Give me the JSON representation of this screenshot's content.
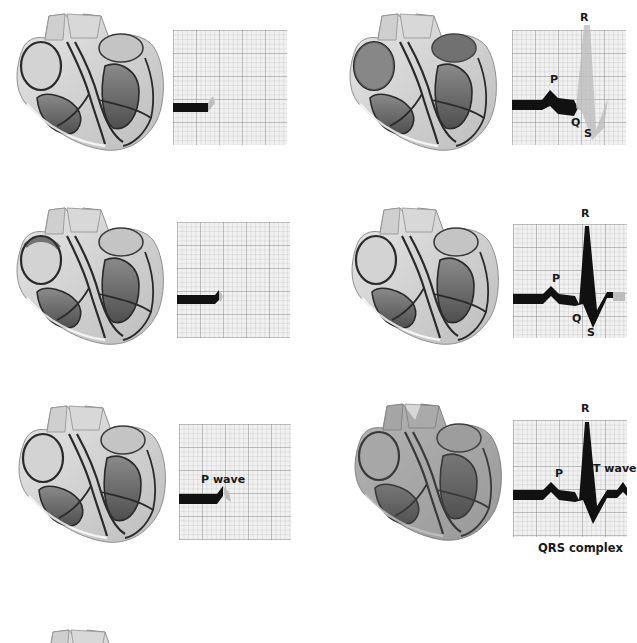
{
  "diagram": {
    "title": "",
    "panels": [
      {
        "id": "panel-1",
        "heart_stage": "sinus node fires",
        "ecg_labels": []
      },
      {
        "id": "panel-2",
        "heart_stage": "atrial depolarization spreading",
        "ecg_labels": []
      },
      {
        "id": "panel-3",
        "heart_stage": "atria depolarized",
        "ecg_labels": [
          "P wave"
        ]
      },
      {
        "id": "panel-4",
        "heart_stage": "ventricular depolarization",
        "ecg_labels": [
          "P",
          "Q",
          "R",
          "S"
        ]
      },
      {
        "id": "panel-5",
        "heart_stage": "ventricles depolarized",
        "ecg_labels": [
          "P",
          "Q",
          "R",
          "S"
        ]
      },
      {
        "id": "panel-6",
        "heart_stage": "ventricular repolarization",
        "ecg_labels": [
          "P",
          "R",
          "T wave"
        ]
      },
      {
        "id": "panel-7",
        "heart_stage": "next cycle (partially visible)",
        "ecg_labels": []
      }
    ],
    "labels": {
      "p_wave": "P wave",
      "p": "P",
      "q": "Q",
      "r": "R",
      "s": "S",
      "t_wave": "T wave",
      "qrs_complex": "QRS complex"
    },
    "colors": {
      "trace": "#111111",
      "trace_pending": "#b8b8b8",
      "grid_bg": "#f1f1f1",
      "heart_outline": "#2a2a2a",
      "heart_fill": "#d9d9d9",
      "heart_dark": "#6a6a6a"
    }
  }
}
